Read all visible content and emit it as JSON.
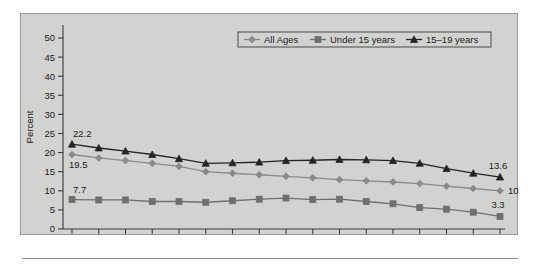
{
  "chart_data": {
    "type": "line",
    "title": "",
    "xlabel": "",
    "ylabel": "Percent",
    "ylim": [
      0,
      50
    ],
    "ytick_step": 5,
    "yticks": [
      "0",
      "5",
      "10",
      "15",
      "20",
      "25",
      "30",
      "35",
      "40",
      "45",
      "50"
    ],
    "grid": false,
    "legend_position": "top-right",
    "categories": [
      "1989",
      "1990",
      "1991",
      "1992",
      "1993",
      "1994",
      "1995",
      "1996",
      "1997",
      "1998",
      "1999",
      "2000",
      "2001",
      "2002",
      "2004",
      "2005",
      "2006"
    ],
    "series": [
      {
        "name": "All Ages",
        "marker": "diamond",
        "color": "#8a8a88",
        "values": [
          19.5,
          18.6,
          17.9,
          17.2,
          16.4,
          15.0,
          14.6,
          14.2,
          13.8,
          13.4,
          12.9,
          12.6,
          12.3,
          11.9,
          11.2,
          10.6,
          10.0
        ]
      },
      {
        "name": "Under 15 years",
        "marker": "square",
        "color": "#6f6f6d",
        "values": [
          7.7,
          7.6,
          7.6,
          7.2,
          7.2,
          7.0,
          7.4,
          7.8,
          8.1,
          7.7,
          7.8,
          7.2,
          6.6,
          5.6,
          5.2,
          4.4,
          3.3
        ]
      },
      {
        "name": "15–19 years",
        "marker": "triangle",
        "color": "#242422",
        "values": [
          22.2,
          21.2,
          20.4,
          19.5,
          18.4,
          17.2,
          17.3,
          17.5,
          17.9,
          18.0,
          18.2,
          18.1,
          17.9,
          17.2,
          15.8,
          14.6,
          13.6
        ]
      }
    ],
    "point_labels": [
      {
        "text": "22.2",
        "series": "15–19 years",
        "index": 0,
        "position": "above-left"
      },
      {
        "text": "19.5",
        "series": "All Ages",
        "index": 0,
        "position": "below-left"
      },
      {
        "text": "7.7",
        "series": "Under 15 years",
        "index": 0,
        "position": "above-left"
      },
      {
        "text": "13.6",
        "series": "15–19 years",
        "index": 16,
        "position": "above-right"
      },
      {
        "text": "10.0",
        "series": "All Ages",
        "index": 16,
        "position": "right"
      },
      {
        "text": "3.3",
        "series": "Under 15 years",
        "index": 16,
        "position": "above-right"
      }
    ]
  },
  "legend": {
    "items": [
      {
        "label": "All Ages",
        "marker": "diamond",
        "color": "#8a8a88"
      },
      {
        "label": "Under 15 years",
        "marker": "square",
        "color": "#6f6f6d"
      },
      {
        "label": "15–19 years",
        "marker": "triangle",
        "color": "#242422"
      }
    ]
  }
}
